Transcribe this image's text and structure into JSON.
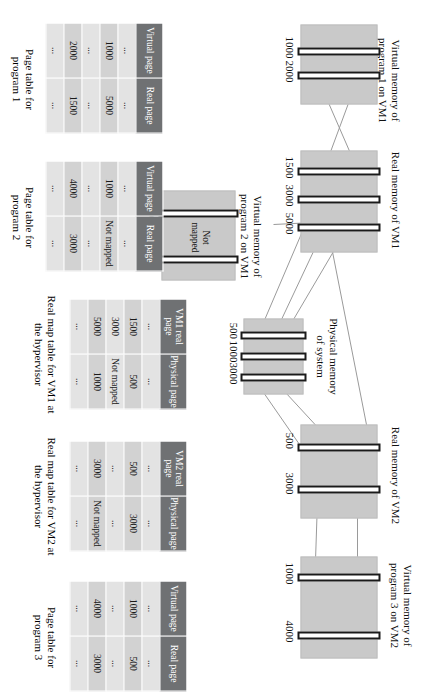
{
  "figure": {
    "memory_blocks": [
      {
        "id": "vm1-prog1-virtual",
        "caption": "Virtual memory of\nprogram 1 on VM1",
        "page_labels": [
          "1000",
          "2000"
        ]
      },
      {
        "id": "vm1-real",
        "caption": "Real memory of VM1",
        "page_labels": [
          "1500",
          "3000",
          "5000"
        ]
      },
      {
        "id": "vm1-prog2-virtual",
        "caption": "Virtual memory of\nprogram 2 on VM1",
        "page_labels": [
          "1000",
          "4000"
        ],
        "inline_note": "Not\nmapped"
      },
      {
        "id": "physical-memory",
        "caption": "Physical memory\nof system",
        "page_labels": [
          "500",
          "1000",
          "3000"
        ]
      },
      {
        "id": "vm2-real",
        "caption": "Real memory of VM2",
        "page_labels": [
          "500",
          "3000"
        ]
      },
      {
        "id": "vm2-prog3-virtual",
        "caption": "Virtual memory of\nprogram 3 on VM2",
        "page_labels": [
          "1000",
          "4000"
        ]
      }
    ],
    "tables": [
      {
        "id": "page-table-program-1",
        "caption": "Page table for\nprogram 1",
        "headers": [
          "Virtual\npage",
          "Real\npage"
        ],
        "rows": [
          [
            "...",
            "..."
          ],
          [
            "1000",
            "5000"
          ],
          [
            "...",
            "..."
          ],
          [
            "2000",
            "1500"
          ],
          [
            "...",
            "..."
          ]
        ]
      },
      {
        "id": "page-table-program-2",
        "caption": "Page table for\nprogram 2",
        "headers": [
          "Virtual\npage",
          "Real\npage"
        ],
        "rows": [
          [
            "...",
            "..."
          ],
          [
            "1000",
            "Not mapped"
          ],
          [
            "...",
            "..."
          ],
          [
            "4000",
            "3000"
          ],
          [
            "...",
            "..."
          ]
        ]
      },
      {
        "id": "real-map-table-vm1",
        "caption": "Real map table for VM1 at\nthe hypervisor",
        "headers": [
          "VM1 real\npage",
          "Physical\npage"
        ],
        "rows": [
          [
            "...",
            "..."
          ],
          [
            "1500",
            "500"
          ],
          [
            "3000",
            "Not mapped"
          ],
          [
            "5000",
            "1000"
          ],
          [
            "...",
            "..."
          ]
        ]
      },
      {
        "id": "real-map-table-vm2",
        "caption": "Real map table for VM2 at\nthe hypervisor",
        "headers": [
          "VM2 real\npage",
          "Physical\npage"
        ],
        "rows": [
          [
            "...",
            "..."
          ],
          [
            "500",
            "3000"
          ],
          [
            "...",
            "..."
          ],
          [
            "3000",
            "Not mapped"
          ],
          [
            "...",
            "..."
          ]
        ]
      },
      {
        "id": "page-table-program-3",
        "caption": "Page table for\nprogram 3",
        "headers": [
          "Virtual\npage",
          "Real\npage"
        ],
        "rows": [
          [
            "...",
            "..."
          ],
          [
            "1000",
            "500"
          ],
          [
            "...",
            "..."
          ],
          [
            "4000",
            "3000"
          ],
          [
            "...",
            "..."
          ]
        ]
      }
    ],
    "colors": {
      "memory_fill": "#c9c9c9",
      "page_border": "#1a1a1a",
      "table_header_bg": "#6f7173",
      "table_header_fg": "#ffffff",
      "table_cell_bg": "#dcdcdc",
      "link_line": "#9a9a9a"
    }
  }
}
